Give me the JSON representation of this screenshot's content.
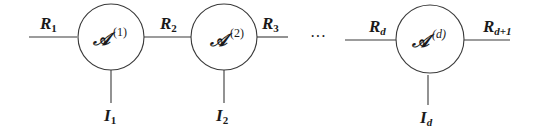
{
  "diagram": {
    "type": "tensor-train-network",
    "nodes": [
      {
        "core": "𝒜",
        "superscript": "(1)",
        "left_rank": {
          "base": "R",
          "sub": "1"
        },
        "right_rank": {
          "base": "R",
          "sub": "2"
        },
        "index": {
          "base": "I",
          "sub": "1"
        }
      },
      {
        "core": "𝒜",
        "superscript": "(2)",
        "left_rank": {
          "base": "R",
          "sub": "2"
        },
        "right_rank": {
          "base": "R",
          "sub": "3"
        },
        "index": {
          "base": "I",
          "sub": "2"
        }
      },
      {
        "core": "𝒜",
        "superscript": "(d)",
        "left_rank": {
          "base": "R",
          "sub": "d"
        },
        "right_rank": {
          "base": "R",
          "sub": "d+1"
        },
        "index": {
          "base": "I",
          "sub": "d"
        }
      }
    ],
    "ellipsis": "···",
    "colors": {
      "stroke": "#3a3a3a",
      "text": "#1a1a1a",
      "background": "#ffffff"
    }
  }
}
